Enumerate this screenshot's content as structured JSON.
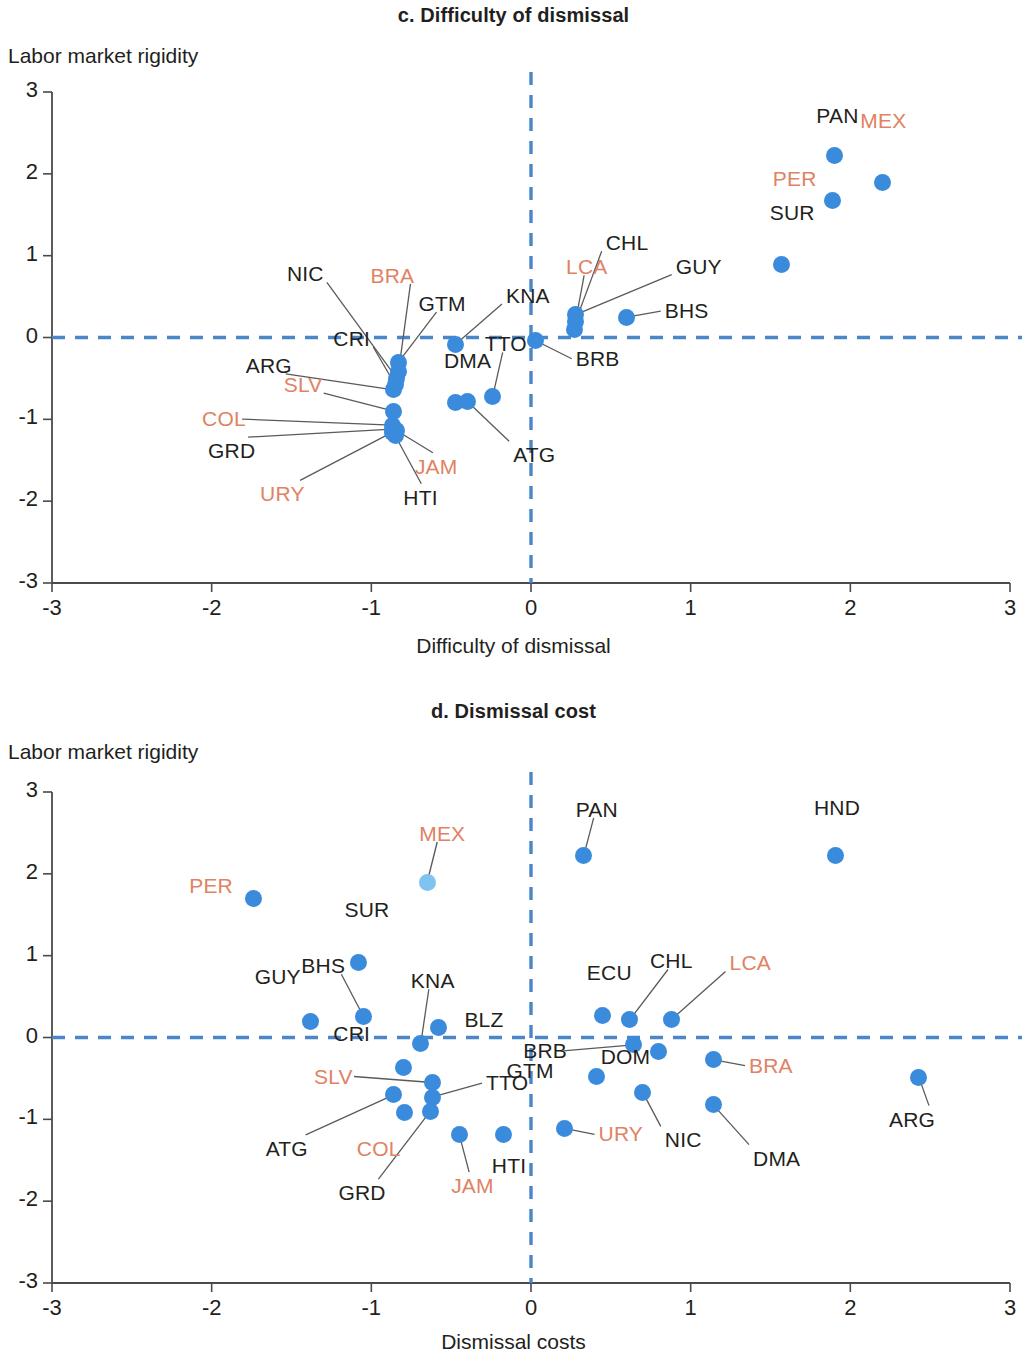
{
  "colors": {
    "dot": "#3b8bdd",
    "dot_light": "#7fc3f0",
    "label_dark": "#231f20",
    "label_red": "#e08263",
    "axis": "#4a4a4a",
    "guideline": "#4a86c8"
  },
  "chart_data": [
    {
      "type": "scatter",
      "panel": "c",
      "title": "c. Difficulty of dismissal",
      "ylabel": "Labor market rigidity",
      "xlabel": "Difficulty of dismissal",
      "xlim": [
        -3,
        3
      ],
      "ylim": [
        -3,
        3
      ],
      "xticks": [
        "-3",
        "-2",
        "-1",
        "0",
        "1",
        "2",
        "3"
      ],
      "yticks": [
        "3",
        "2",
        "1",
        "0",
        "-1",
        "-2",
        "-3"
      ],
      "grid": false,
      "legend": "none",
      "reference_lines": {
        "x": 0,
        "y": 0
      },
      "points": [
        {
          "code": "PAN",
          "x": 1.9,
          "y": 2.22,
          "color": "dot",
          "label_color": "dark",
          "label_dx": -18,
          "label_dy": -40,
          "leader": false
        },
        {
          "code": "MEX",
          "x": 2.2,
          "y": 1.89,
          "color": "dot",
          "label_color": "red",
          "label_dx": -22,
          "label_dy": -62,
          "leader": false
        },
        {
          "code": "PER",
          "x": 1.89,
          "y": 1.67,
          "color": "dot",
          "label_color": "red",
          "label_dx": -60,
          "label_dy": -22,
          "leader": false
        },
        {
          "code": "SUR",
          "x": 1.57,
          "y": 0.89,
          "color": "dot",
          "label_color": "dark",
          "label_dx": -12,
          "label_dy": -52,
          "leader": false
        },
        {
          "code": "GUY",
          "x": 0.28,
          "y": 0.28,
          "color": "dot",
          "label_color": "dark",
          "label_dx": 100,
          "label_dy": -48,
          "leader": true
        },
        {
          "code": "CHL",
          "x": 0.28,
          "y": 0.2,
          "color": "dot",
          "label_color": "dark",
          "label_dx": 30,
          "label_dy": -78,
          "leader": true
        },
        {
          "code": "LCA",
          "x": 0.27,
          "y": 0.1,
          "color": "dot",
          "label_color": "red",
          "label_dx": -8,
          "label_dy": -62,
          "leader": true
        },
        {
          "code": "BHS",
          "x": 0.6,
          "y": 0.25,
          "color": "dot",
          "label_color": "dark",
          "label_dx": 38,
          "label_dy": -6,
          "leader": true
        },
        {
          "code": "BRB",
          "x": 0.03,
          "y": -0.04,
          "color": "dot",
          "label_color": "dark",
          "label_dx": 40,
          "label_dy": 18,
          "leader": true
        },
        {
          "code": "KNA",
          "x": -0.47,
          "y": -0.08,
          "color": "dot",
          "label_color": "dark",
          "label_dx": 50,
          "label_dy": -48,
          "leader": true
        },
        {
          "code": "GTM",
          "x": -0.83,
          "y": -0.3,
          "color": "dot",
          "label_color": "dark",
          "label_dx": 20,
          "label_dy": -58,
          "leader": true
        },
        {
          "code": "BRA",
          "x": -0.83,
          "y": -0.42,
          "color": "dot",
          "label_color": "red",
          "label_dx": -28,
          "label_dy": -96,
          "leader": true
        },
        {
          "code": "NIC",
          "x": -0.84,
          "y": -0.5,
          "color": "dot",
          "label_color": "dark",
          "label_dx": -110,
          "label_dy": -104,
          "leader": true
        },
        {
          "code": "CRI",
          "x": -0.85,
          "y": -0.58,
          "color": "dot",
          "label_color": "dark",
          "label_dx": -62,
          "label_dy": -46,
          "leader": true
        },
        {
          "code": "ARG",
          "x": -0.86,
          "y": -0.64,
          "color": "dot",
          "label_color": "dark",
          "label_dx": -148,
          "label_dy": -24,
          "leader": true
        },
        {
          "code": "SLV",
          "x": -0.86,
          "y": -0.9,
          "color": "red",
          "label_color": "red",
          "label_dx": -110,
          "label_dy": -26,
          "leader": true
        },
        {
          "code": "COL",
          "x": -0.87,
          "y": -1.07,
          "color": "dot",
          "label_color": "red",
          "label_dx": -190,
          "label_dy": -6,
          "leader": true
        },
        {
          "code": "GRD",
          "x": -0.87,
          "y": -1.12,
          "color": "dot",
          "label_color": "dark",
          "label_dx": -184,
          "label_dy": 22,
          "leader": true
        },
        {
          "code": "URY",
          "x": -0.87,
          "y": -1.16,
          "color": "dot",
          "label_color": "red",
          "label_dx": -132,
          "label_dy": 62,
          "leader": true
        },
        {
          "code": "HTI",
          "x": -0.85,
          "y": -1.2,
          "color": "dot",
          "label_color": "dark",
          "label_dx": 8,
          "label_dy": 62,
          "leader": true
        },
        {
          "code": "JAM",
          "x": -0.84,
          "y": -1.14,
          "color": "dot",
          "label_color": "red",
          "label_dx": 18,
          "label_dy": 36,
          "leader": true
        },
        {
          "code": "DMA",
          "x": -0.47,
          "y": -0.8,
          "color": "dot",
          "label_color": "dark",
          "label_dx": -12,
          "label_dy": -42,
          "leader": false
        },
        {
          "code": "ATG",
          "x": -0.4,
          "y": -0.78,
          "color": "dot",
          "label_color": "dark",
          "label_dx": 46,
          "label_dy": 54,
          "leader": true
        },
        {
          "code": "TTO",
          "x": -0.24,
          "y": -0.72,
          "color": "dot",
          "label_color": "dark",
          "label_dx": -8,
          "label_dy": -52,
          "leader": true
        }
      ]
    },
    {
      "type": "scatter",
      "panel": "d",
      "title": "d. Dismissal cost",
      "ylabel": "Labor market rigidity",
      "xlabel": "Dismissal costs",
      "xlim": [
        -3,
        3
      ],
      "ylim": [
        -3,
        3
      ],
      "xticks": [
        "-3",
        "-2",
        "-1",
        "0",
        "1",
        "2",
        "3"
      ],
      "yticks": [
        "3",
        "2",
        "1",
        "0",
        "-1",
        "-2",
        "-3"
      ],
      "grid": false,
      "legend": "none",
      "reference_lines": {
        "x": 0,
        "y": 0
      },
      "points": [
        {
          "code": "PAN",
          "x": 0.33,
          "y": 2.22,
          "color": "dot",
          "label_color": "dark",
          "label_dx": -8,
          "label_dy": -46,
          "leader": true
        },
        {
          "code": "HND",
          "x": 1.91,
          "y": 2.22,
          "color": "dot",
          "label_color": "dark",
          "label_dx": -22,
          "label_dy": -48,
          "leader": false
        },
        {
          "code": "MEX",
          "x": -0.65,
          "y": 1.9,
          "color": "light",
          "label_color": "red",
          "label_dx": -8,
          "label_dy": -48,
          "leader": true
        },
        {
          "code": "PER",
          "x": -1.74,
          "y": 1.7,
          "color": "dot",
          "label_color": "red",
          "label_dx": -64,
          "label_dy": -12,
          "leader": false
        },
        {
          "code": "SUR",
          "x": -1.08,
          "y": 0.92,
          "color": "dot",
          "label_color": "dark",
          "label_dx": -14,
          "label_dy": -52,
          "leader": false
        },
        {
          "code": "BHS",
          "x": -1.05,
          "y": 0.26,
          "color": "dot",
          "label_color": "dark",
          "label_dx": -62,
          "label_dy": -50,
          "leader": true
        },
        {
          "code": "GUY",
          "x": -1.38,
          "y": 0.2,
          "color": "dot",
          "label_color": "dark",
          "label_dx": -56,
          "label_dy": -44,
          "leader": false
        },
        {
          "code": "BLZ",
          "x": -0.58,
          "y": 0.12,
          "color": "dot",
          "label_color": "dark",
          "label_dx": 26,
          "label_dy": -8,
          "leader": false
        },
        {
          "code": "KNA",
          "x": -0.69,
          "y": -0.07,
          "color": "dot",
          "label_color": "dark",
          "label_dx": -10,
          "label_dy": -62,
          "leader": true
        },
        {
          "code": "ECU",
          "x": 0.45,
          "y": 0.27,
          "color": "dot",
          "label_color": "dark",
          "label_dx": -16,
          "label_dy": -42,
          "leader": false
        },
        {
          "code": "CHL",
          "x": 0.62,
          "y": 0.22,
          "color": "dot",
          "label_color": "dark",
          "label_dx": 20,
          "label_dy": -58,
          "leader": true
        },
        {
          "code": "LCA",
          "x": 0.88,
          "y": 0.22,
          "color": "dot",
          "label_color": "red",
          "label_dx": 58,
          "label_dy": -56,
          "leader": true
        },
        {
          "code": "BRB",
          "x": 0.64,
          "y": -0.09,
          "color": "dot",
          "label_color": "dark",
          "label_dx": -110,
          "label_dy": 6,
          "leader": true
        },
        {
          "code": "DOM",
          "x": 0.8,
          "y": -0.17,
          "color": "dot",
          "label_color": "dark",
          "label_dx": -58,
          "label_dy": 6,
          "leader": false
        },
        {
          "code": "BRA",
          "x": 1.14,
          "y": -0.27,
          "color": "dot",
          "label_color": "red",
          "label_dx": 36,
          "label_dy": 6,
          "leader": true
        },
        {
          "code": "GTM",
          "x": 0.41,
          "y": -0.48,
          "color": "dot",
          "label_color": "dark",
          "label_dx": -90,
          "label_dy": -6,
          "leader": false
        },
        {
          "code": "CRI",
          "x": -0.8,
          "y": -0.37,
          "color": "dot",
          "label_color": "dark",
          "label_dx": -70,
          "label_dy": -34,
          "leader": false
        },
        {
          "code": "SLV",
          "x": -0.62,
          "y": -0.55,
          "color": "dot",
          "label_color": "red",
          "label_dx": -118,
          "label_dy": -6,
          "leader": true
        },
        {
          "code": "TTO",
          "x": -0.62,
          "y": -0.73,
          "color": "dot",
          "label_color": "dark",
          "label_dx": 54,
          "label_dy": -14,
          "leader": true
        },
        {
          "code": "ATG",
          "x": -0.86,
          "y": -0.7,
          "color": "dot",
          "label_color": "dark",
          "label_dx": -128,
          "label_dy": 54,
          "leader": true
        },
        {
          "code": "COL",
          "x": -0.79,
          "y": -0.92,
          "color": "dot",
          "label_color": "red",
          "label_dx": -48,
          "label_dy": 36,
          "leader": false
        },
        {
          "code": "GRD",
          "x": -0.63,
          "y": -0.9,
          "color": "dot",
          "label_color": "dark",
          "label_dx": -92,
          "label_dy": 82,
          "leader": true
        },
        {
          "code": "JAM",
          "x": -0.45,
          "y": -1.18,
          "color": "dot",
          "label_color": "red",
          "label_dx": -8,
          "label_dy": 52,
          "leader": true
        },
        {
          "code": "HTI",
          "x": -0.17,
          "y": -1.18,
          "color": "dot",
          "label_color": "dark",
          "label_dx": -12,
          "label_dy": 32,
          "leader": false
        },
        {
          "code": "URY",
          "x": 0.21,
          "y": -1.11,
          "color": "dot",
          "label_color": "red",
          "label_dx": 34,
          "label_dy": 6,
          "leader": true
        },
        {
          "code": "NIC",
          "x": 0.7,
          "y": -0.67,
          "color": "dot",
          "label_color": "dark",
          "label_dx": 22,
          "label_dy": 48,
          "leader": true
        },
        {
          "code": "DMA",
          "x": 1.14,
          "y": -0.82,
          "color": "dot",
          "label_color": "dark",
          "label_dx": 40,
          "label_dy": 54,
          "leader": true
        },
        {
          "code": "ARG",
          "x": 2.43,
          "y": -0.49,
          "color": "dot",
          "label_color": "dark",
          "label_dx": -30,
          "label_dy": 42,
          "leader": true
        }
      ]
    }
  ]
}
